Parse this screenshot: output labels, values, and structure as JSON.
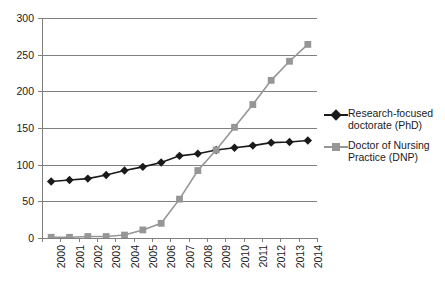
{
  "chart_data": {
    "type": "line",
    "title": "",
    "xlabel": "",
    "ylabel": "",
    "categories": [
      "2000",
      "2001",
      "2002",
      "2003",
      "2004",
      "2005",
      "2006",
      "2007",
      "2008",
      "2009",
      "2010",
      "2011",
      "2012",
      "2013",
      "2014"
    ],
    "ylim": [
      0,
      300
    ],
    "yticks": [
      0,
      50,
      100,
      150,
      200,
      250,
      300
    ],
    "grid": "horizontal",
    "legend_position": "right",
    "series": [
      {
        "name": "Research-focused doctorate (PhD)",
        "color": "#1a1a1a",
        "marker": "diamond",
        "values": [
          77,
          79,
          81,
          86,
          92,
          97,
          103,
          112,
          115,
          120,
          123,
          126,
          130,
          131,
          133
        ]
      },
      {
        "name": "Doctor of Nursing Practice (DNP)",
        "color": "#969696",
        "marker": "square",
        "values": [
          1,
          1,
          2,
          2,
          4,
          11,
          20,
          53,
          92,
          120,
          151,
          182,
          215,
          241,
          264
        ]
      }
    ]
  },
  "legend": {
    "entries": [
      {
        "label": "Research-focused doctorate (PhD)"
      },
      {
        "label": "Doctor of Nursing Practice (DNP)"
      }
    ]
  },
  "colors": {
    "phd": "#1a1a1a",
    "dnp": "#969696",
    "grid": "#808080",
    "background": "#ffffff"
  }
}
